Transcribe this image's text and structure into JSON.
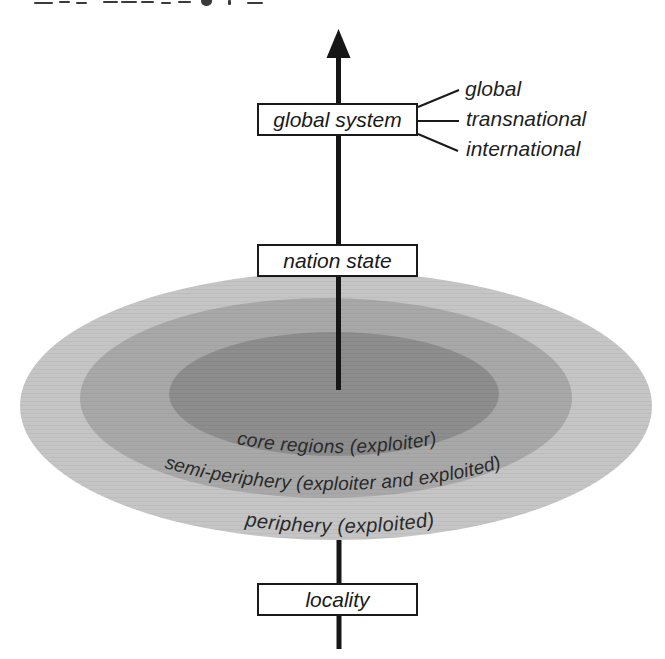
{
  "arrow": {
    "color": "#161616"
  },
  "levels": [
    {
      "id": "global-system",
      "label": "global system"
    },
    {
      "id": "nation-state",
      "label": "nation state"
    },
    {
      "id": "locality",
      "label": "locality"
    }
  ],
  "callouts": [
    "global",
    "transnational",
    "international"
  ],
  "zones": [
    {
      "id": "periphery",
      "label": "periphery (exploited)",
      "fill": "#c5c5c5"
    },
    {
      "id": "semi-periphery",
      "label": "semi-periphery (exploiter and exploited)",
      "fill": "#a8a8a8"
    },
    {
      "id": "core",
      "label": "core regions (exploiter)",
      "fill": "#8d8d8d"
    }
  ]
}
